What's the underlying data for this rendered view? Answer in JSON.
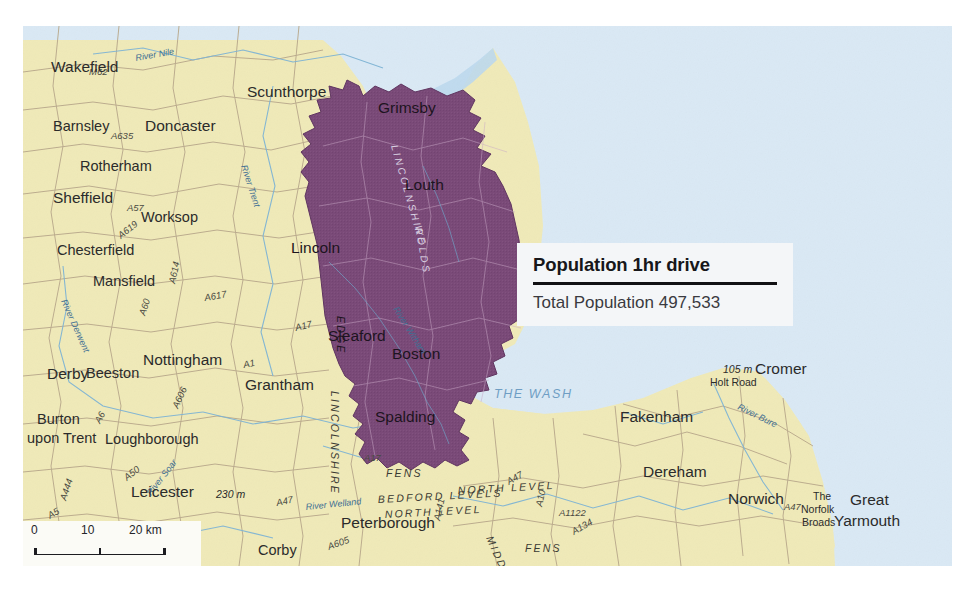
{
  "page": {
    "bleed_text": "and conclusions"
  },
  "callout": {
    "title": "Population 1hr drive",
    "subtitle": "Total Population 497,533"
  },
  "scalebar": {
    "zero": "0",
    "mid": "10",
    "end": "20 km"
  },
  "colors": {
    "land": "#f0eab8",
    "sea": "#dae9f5",
    "catchment_purple": "#7a4a78",
    "road": "#b9a98c",
    "river": "#7fb4d4",
    "callout_bg": "#f4f6f8",
    "rule": "#111114"
  },
  "map": {
    "towns": [
      {
        "name": "Wakefield",
        "x": 28,
        "y": 46,
        "cls": "city"
      },
      {
        "name": "Barnsley",
        "x": 30,
        "y": 105,
        "cls": "town"
      },
      {
        "name": "Doncaster",
        "x": 122,
        "y": 105,
        "cls": "city"
      },
      {
        "name": "Rotherham",
        "x": 57,
        "y": 145,
        "cls": "town"
      },
      {
        "name": "Sheffield",
        "x": 30,
        "y": 177,
        "cls": "city"
      },
      {
        "name": "Worksop",
        "x": 118,
        "y": 196,
        "cls": "town"
      },
      {
        "name": "Chesterfield",
        "x": 34,
        "y": 229,
        "cls": "town"
      },
      {
        "name": "Mansfield",
        "x": 70,
        "y": 260,
        "cls": "town"
      },
      {
        "name": "Nottingham",
        "x": 120,
        "y": 339,
        "cls": "city"
      },
      {
        "name": "Beeston",
        "x": 63,
        "y": 352,
        "cls": "town"
      },
      {
        "name": "Derby",
        "x": 24,
        "y": 353,
        "cls": "city"
      },
      {
        "name": "Burton",
        "x": 14,
        "y": 398,
        "cls": "town"
      },
      {
        "name": "upon Trent",
        "x": 4,
        "y": 417,
        "cls": "town"
      },
      {
        "name": "Loughborough",
        "x": 82,
        "y": 418,
        "cls": "town"
      },
      {
        "name": "Leicester",
        "x": 108,
        "y": 471,
        "cls": "city"
      },
      {
        "name": "Corby",
        "x": 235,
        "y": 529,
        "cls": "town"
      },
      {
        "name": "Peterborough",
        "x": 318,
        "y": 502,
        "cls": "city"
      },
      {
        "name": "Grantham",
        "x": 222,
        "y": 364,
        "cls": "city"
      },
      {
        "name": "Scunthorpe",
        "x": 224,
        "y": 71,
        "cls": "city"
      },
      {
        "name": "Grimsby",
        "x": 355,
        "y": 87,
        "cls": "city-purple"
      },
      {
        "name": "Louth",
        "x": 382,
        "y": 164,
        "cls": "city-purple"
      },
      {
        "name": "Lincoln",
        "x": 268,
        "y": 227,
        "cls": "city-purple"
      },
      {
        "name": "Sleaford",
        "x": 305,
        "y": 315,
        "cls": "city-purple"
      },
      {
        "name": "Boston",
        "x": 369,
        "y": 333,
        "cls": "city-purple"
      },
      {
        "name": "Spalding",
        "x": 352,
        "y": 396,
        "cls": "city-purple"
      },
      {
        "name": "Fakenham",
        "x": 597,
        "y": 396,
        "cls": "city"
      },
      {
        "name": "Dereham",
        "x": 620,
        "y": 451,
        "cls": "city"
      },
      {
        "name": "Norwich",
        "x": 705,
        "y": 478,
        "cls": "city"
      },
      {
        "name": "Cromer",
        "x": 732,
        "y": 348,
        "cls": "city"
      },
      {
        "name": "Great",
        "x": 827,
        "y": 479,
        "cls": "city"
      },
      {
        "name": "Yarmouth",
        "x": 811,
        "y": 500,
        "cls": "city"
      }
    ],
    "spot_labels": [
      {
        "name": "The",
        "x": 790,
        "y": 474,
        "cls": "spot"
      },
      {
        "name": "Norfolk",
        "x": 778,
        "y": 487,
        "cls": "spot"
      },
      {
        "name": "Broads",
        "x": 779,
        "y": 500,
        "cls": "spot"
      },
      {
        "name": "105 m",
        "x": 700,
        "y": 347,
        "cls": "spot-i"
      },
      {
        "name": "Holt Road",
        "x": 687,
        "y": 360,
        "cls": "spot"
      },
      {
        "name": "230 m",
        "x": 193,
        "y": 472,
        "cls": "spot-i"
      }
    ],
    "roads": [
      {
        "name": "M62",
        "x": 66,
        "y": 49,
        "rot": 0
      },
      {
        "name": "A635",
        "x": 88,
        "y": 113,
        "rot": 0
      },
      {
        "name": "A57",
        "x": 104,
        "y": 185,
        "rot": 0
      },
      {
        "name": "A619",
        "x": 98,
        "y": 213,
        "rot": -38
      },
      {
        "name": "A614",
        "x": 152,
        "y": 258,
        "rot": -78
      },
      {
        "name": "A617",
        "x": 182,
        "y": 275,
        "rot": -10
      },
      {
        "name": "A60",
        "x": 122,
        "y": 290,
        "rot": -72
      },
      {
        "name": "A606",
        "x": 155,
        "y": 383,
        "rot": -66
      },
      {
        "name": "A6",
        "x": 77,
        "y": 398,
        "rot": -62
      },
      {
        "name": "A50",
        "x": 104,
        "y": 455,
        "rot": -38
      },
      {
        "name": "A444",
        "x": 43,
        "y": 475,
        "rot": -72
      },
      {
        "name": "A5",
        "x": 27,
        "y": 493,
        "rot": -30
      },
      {
        "name": "A1",
        "x": 221,
        "y": 342,
        "rot": -12
      },
      {
        "name": "A17",
        "x": 273,
        "y": 305,
        "rot": -14
      },
      {
        "name": "A17",
        "x": 341,
        "y": 435,
        "rot": 0
      },
      {
        "name": "A605",
        "x": 306,
        "y": 524,
        "rot": -20
      },
      {
        "name": "A47",
        "x": 254,
        "y": 480,
        "rot": -12
      },
      {
        "name": "A141",
        "x": 417,
        "y": 495,
        "rot": -78
      },
      {
        "name": "A47",
        "x": 486,
        "y": 459,
        "rot": -30
      },
      {
        "name": "A10",
        "x": 519,
        "y": 481,
        "rot": -78
      },
      {
        "name": "A1122",
        "x": 536,
        "y": 490,
        "rot": 0
      },
      {
        "name": "A134",
        "x": 551,
        "y": 509,
        "rot": -30
      },
      {
        "name": "A47",
        "x": 761,
        "y": 484,
        "rot": 0
      }
    ],
    "rivers": [
      {
        "name": "River Nile",
        "x": 113,
        "y": 35,
        "rot": -10
      },
      {
        "name": "River Trent",
        "x": 218,
        "y": 140,
        "rot": 72
      },
      {
        "name": "River Derwent",
        "x": 38,
        "y": 275,
        "rot": 66
      },
      {
        "name": "River Witham",
        "x": 370,
        "y": 283,
        "rot": 58
      },
      {
        "name": "River Welland",
        "x": 283,
        "y": 484,
        "rot": -6
      },
      {
        "name": "River Soar",
        "x": 128,
        "y": 470,
        "rot": -52
      },
      {
        "name": "River Bure",
        "x": 714,
        "y": 383,
        "rot": 26
      }
    ],
    "regions": [
      {
        "name": "THE WASH",
        "x": 471,
        "y": 372,
        "rot": 0,
        "cls": "sea-lbl"
      },
      {
        "name": "LINCOLNSHIRE",
        "x": 308,
        "y": 365,
        "rot": 90,
        "cls": "region"
      },
      {
        "name": "EDGE",
        "x": 314,
        "y": 290,
        "rot": 90,
        "cls": "region-on-purple"
      },
      {
        "name": "LINCOLNSHIRE",
        "x": 368,
        "y": 120,
        "rot": 74,
        "cls": "region-lt"
      },
      {
        "name": "WOLDS",
        "x": 392,
        "y": 200,
        "rot": 80,
        "cls": "region-lt"
      },
      {
        "name": "FENS",
        "x": 363,
        "y": 451,
        "rot": 0,
        "cls": "region"
      },
      {
        "name": "BEDFORD LEVELS",
        "x": 355,
        "y": 477,
        "rot": -3,
        "cls": "region"
      },
      {
        "name": "NORTH LEVEL",
        "x": 362,
        "y": 492,
        "rot": -3,
        "cls": "region"
      },
      {
        "name": "NORTH LEVEL",
        "x": 435,
        "y": 468,
        "rot": -3,
        "cls": "region"
      },
      {
        "name": "MIDDLE LEVEL",
        "x": 463,
        "y": 512,
        "rot": 66,
        "cls": "region"
      },
      {
        "name": "MIDDLE LEVEL",
        "x": 375,
        "y": 551,
        "rot": 0,
        "cls": "region"
      },
      {
        "name": "FENS",
        "x": 502,
        "y": 526,
        "rot": 0,
        "cls": "region"
      }
    ],
    "marker": {
      "name": "origin-point",
      "x": 512,
      "y": 283
    }
  }
}
